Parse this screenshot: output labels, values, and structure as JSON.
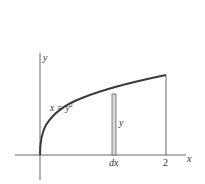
{
  "diagram": {
    "type": "area-under-curve",
    "curve_equation": "x = y²",
    "curve_label_text": "x = y",
    "curve_label_sup": "2",
    "axes": {
      "x_label": "x",
      "y_label": "y"
    },
    "tick_labels": {
      "x_end": "2",
      "strip_width": "dx"
    },
    "strip_height_label": "y",
    "colors": {
      "curve": "#3a3a3a",
      "axes": "#555555",
      "strip_fill": "#d9d9d9",
      "text": "#333333",
      "background": "#ffffff"
    }
  }
}
